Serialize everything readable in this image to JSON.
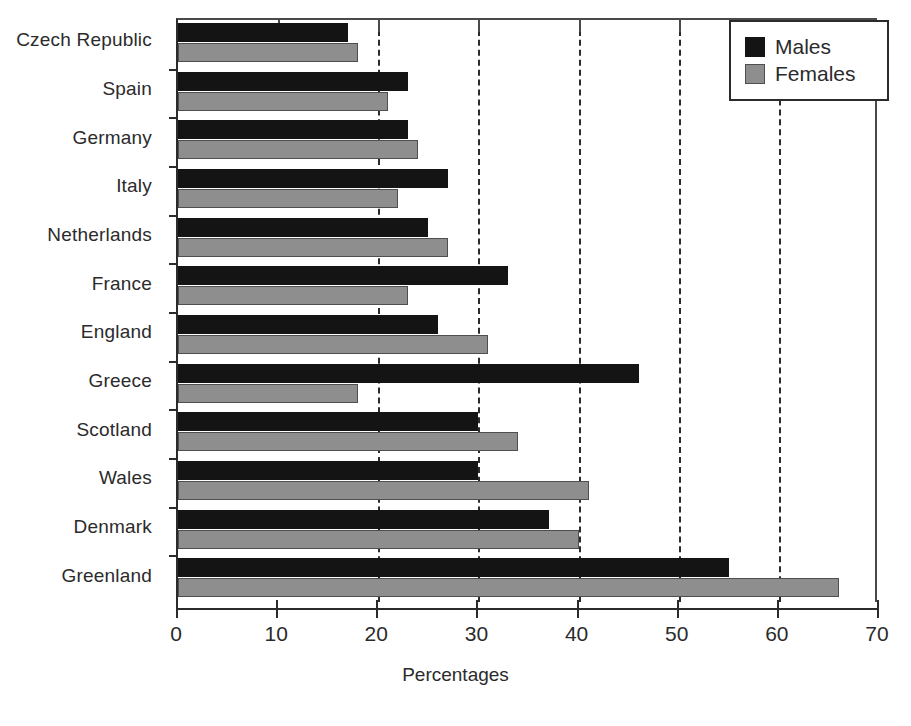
{
  "chart_data": {
    "type": "bar",
    "orientation": "horizontal",
    "title": "",
    "xlabel": "Percentages",
    "ylabel": "",
    "xlim": [
      0,
      70
    ],
    "xticks": [
      0,
      10,
      20,
      30,
      40,
      50,
      60,
      70
    ],
    "xtick_labels": [
      "0",
      "10",
      "20",
      "30",
      "40",
      "50",
      "60",
      "70"
    ],
    "gridlines_at": [
      20,
      30,
      40,
      50,
      60
    ],
    "grid": "vertical-dashed",
    "legend_position": "top-right",
    "categories": [
      "Czech Republic",
      "Spain",
      "Germany",
      "Italy",
      "Netherlands",
      "France",
      "England",
      "Greece",
      "Scotland",
      "Wales",
      "Denmark",
      "Greenland"
    ],
    "series": [
      {
        "name": "Males",
        "color": "#141414",
        "values": [
          17,
          23,
          23,
          27,
          25,
          33,
          26,
          46,
          30,
          30,
          37,
          55
        ]
      },
      {
        "name": "Females",
        "color": "#8e8e8e",
        "values": [
          18,
          21,
          24,
          22,
          27,
          23,
          31,
          18,
          34,
          41,
          40,
          66
        ]
      }
    ]
  },
  "legend": {
    "items": [
      {
        "label": "Males",
        "swatch": "males"
      },
      {
        "label": "Females",
        "swatch": "females"
      }
    ]
  },
  "axis": {
    "x_title": "Percentages"
  }
}
